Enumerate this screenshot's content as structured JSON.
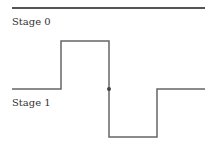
{
  "diagram": {
    "type": "timing-waveform",
    "labels": {
      "stage0": "Stage 0",
      "stage1": "Stage 1"
    },
    "colors": {
      "line": "#555555",
      "text": "#333333",
      "dot": "#444444"
    },
    "stage0_line": {
      "y": 8,
      "x_start": 12,
      "x_end": 205
    },
    "waveform": {
      "points": [
        [
          12,
          89
        ],
        [
          61,
          89
        ],
        [
          61,
          41
        ],
        [
          109,
          41
        ],
        [
          109,
          137
        ],
        [
          157,
          137
        ],
        [
          157,
          89
        ],
        [
          205,
          89
        ]
      ],
      "junction_dot": [
        109,
        89
      ]
    }
  }
}
